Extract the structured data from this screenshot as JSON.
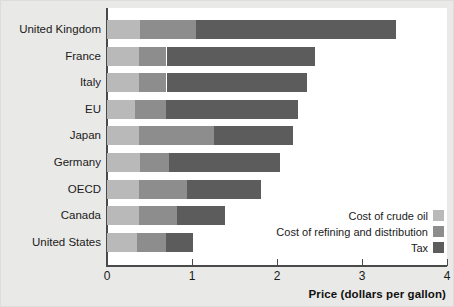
{
  "chart_data": {
    "type": "bar",
    "orientation": "horizontal",
    "stacked": true,
    "title": "",
    "xlabel": "Price (dollars per gallon)",
    "ylabel": "",
    "xlim": [
      0,
      4
    ],
    "xticks": [
      "0",
      "1",
      "2",
      "3",
      "4"
    ],
    "grid": false,
    "legend_position": "bottom-right",
    "categories": [
      "United Kingdom",
      "France",
      "Italy",
      "EU",
      "Japan",
      "Germany",
      "OECD",
      "Canada",
      "United States"
    ],
    "series": [
      {
        "name": "Cost of crude oil",
        "color": "#b9b9b9",
        "values": [
          0.39,
          0.38,
          0.38,
          0.33,
          0.38,
          0.39,
          0.38,
          0.38,
          0.35
        ]
      },
      {
        "name": "Cost of refining and distribution",
        "color": "#8d8d8d",
        "values": [
          0.66,
          0.32,
          0.32,
          0.36,
          0.88,
          0.34,
          0.56,
          0.44,
          0.34
        ]
      },
      {
        "name": "Tax",
        "color": "#5c5c5c",
        "values": [
          2.35,
          1.75,
          1.65,
          1.56,
          0.93,
          1.31,
          0.87,
          0.57,
          0.32
        ]
      }
    ],
    "totals": [
      3.4,
      2.45,
      2.35,
      2.25,
      2.19,
      2.04,
      1.81,
      1.39,
      1.01
    ]
  },
  "legend": {
    "items": [
      {
        "label": "Cost of crude oil",
        "color": "#b9b9b9"
      },
      {
        "label": "Cost of refining and distribution",
        "color": "#8d8d8d"
      },
      {
        "label": "Tax",
        "color": "#5c5c5c"
      }
    ]
  },
  "axis": {
    "x_title": "Price (dollars per gallon)",
    "x_tick_labels": [
      "0",
      "1",
      "2",
      "3",
      "4"
    ]
  },
  "colors": {
    "background": "#e9e9e7",
    "plot_background": "#ffffff",
    "axis": "#4a4a4a",
    "crude": "#b9b9b9",
    "refining": "#8d8d8d",
    "tax": "#5c5c5c"
  }
}
